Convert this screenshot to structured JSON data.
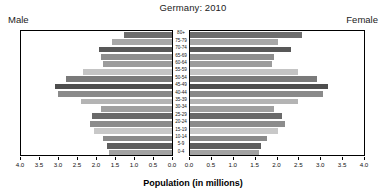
{
  "header": {
    "title": "Germany: 2010",
    "male_label": "Male",
    "female_label": "Female"
  },
  "axis": {
    "x_title": "Population (in millions)",
    "male_ticks": [
      "4.0",
      "3.5",
      "3.0",
      "2.5",
      "2.0",
      "1.5",
      "1.0",
      "0.5",
      "0.0"
    ],
    "female_ticks": [
      "0.0",
      "0.5",
      "1.0",
      "1.5",
      "2.0",
      "2.5",
      "3.0",
      "3.5",
      "4.0"
    ]
  },
  "chart_data": {
    "type": "bar",
    "subtype": "population-pyramid",
    "title": "Germany: 2010",
    "xlabel": "Population (in millions)",
    "ylabel": "",
    "xlim": [
      0,
      4.0
    ],
    "grid": false,
    "legend": [
      "Male",
      "Female"
    ],
    "legend_position": "top-outside",
    "categories": [
      "80+",
      "75-79",
      "70-74",
      "65-69",
      "60-64",
      "55-59",
      "50-54",
      "45-49",
      "40-44",
      "35-39",
      "30-34",
      "25-29",
      "20-24",
      "15-19",
      "10-14",
      "5-9",
      "0-4"
    ],
    "series": [
      {
        "name": "Male",
        "values": [
          1.3,
          1.6,
          1.95,
          1.9,
          1.85,
          2.4,
          2.85,
          3.15,
          3.05,
          2.45,
          1.9,
          2.15,
          2.2,
          2.1,
          1.85,
          1.75,
          1.7
        ]
      },
      {
        "name": "Female",
        "values": [
          2.6,
          2.05,
          2.35,
          1.95,
          1.9,
          2.5,
          2.95,
          3.2,
          3.1,
          2.5,
          1.95,
          2.15,
          2.2,
          2.05,
          1.8,
          1.65,
          1.6
        ]
      }
    ],
    "age_labels": [
      "80+",
      "75-79",
      "70-74",
      "65-69",
      "60-64",
      "55-59",
      "50-54",
      "45-49",
      "40-44",
      "35-39",
      "30-34",
      "25-29",
      "20-24",
      "15-19",
      "10-14",
      "5-9",
      "0-4"
    ],
    "bar_colors": [
      "#6e6e6e",
      "#a8a8a8",
      "#585858",
      "#8e8e8e",
      "#9c9c9c",
      "#c4c4c4",
      "#7a7a7a",
      "#4e4e4e",
      "#8a8a8a",
      "#b4b4b4",
      "#a0a0a0",
      "#6a6a6a",
      "#8c8c8c",
      "#c8c8c8",
      "#8a8a8a",
      "#5e5e5e",
      "#a2a2a2"
    ]
  },
  "colors": {
    "frame": "#000000",
    "background": "#ffffff",
    "text": "#1a1a1a"
  }
}
